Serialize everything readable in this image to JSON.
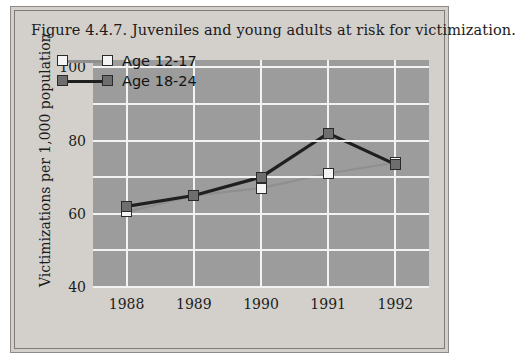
{
  "figure": {
    "title": "Figure 4.4.7. Juveniles and young adults at risk for victimization."
  },
  "colors": {
    "page_background": "#ffffff",
    "figure_background": "#d3d0cb",
    "plot_background": "#9c9c9c",
    "gridline": "#f2f2f2",
    "series_light_marker": "#f4f4f4",
    "series_dark_marker": "#6e6e6e",
    "series_light_line": "#8f8f8f",
    "series_dark_line": "#1f1f1f",
    "text": "#1c1c1c"
  },
  "chart_data": {
    "type": "line",
    "title": "Figure 4.4.7. Juveniles and young adults at risk for victimization.",
    "xlabel": "",
    "ylabel": "Victimizations per 1,000 population",
    "categories": [
      "1988",
      "1989",
      "1990",
      "1991",
      "1992"
    ],
    "x_tick_labels": [
      "1988",
      "1989",
      "1990",
      "1991",
      "1992"
    ],
    "y_tick_labels": [
      "40",
      "60",
      "80",
      "100"
    ],
    "y_major_ticks": [
      40,
      60,
      80,
      100
    ],
    "y_minor_gridlines": [
      50,
      70,
      90
    ],
    "ylim": [
      40,
      102
    ],
    "grid": true,
    "legend_position": "upper-left-inside",
    "series": [
      {
        "name": "Age 12-17",
        "marker": "square-light",
        "values": [
          60.5,
          65,
          67,
          71,
          74
        ]
      },
      {
        "name": "Age 18-24",
        "marker": "square-dark",
        "values": [
          62,
          65,
          70,
          82,
          73.5
        ]
      }
    ]
  },
  "legend": {
    "items": [
      {
        "label": "Age 12-17",
        "style": "light"
      },
      {
        "label": "Age 18-24",
        "style": "dark"
      }
    ]
  }
}
